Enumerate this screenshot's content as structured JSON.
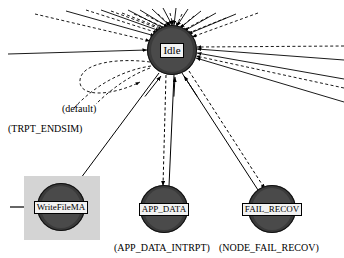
{
  "diagram": {
    "background_color": "#ffffff",
    "node_fill_color": "#3a3a3a",
    "label_box_color": "#f2f2f2",
    "selection_box_color": "#d4d4d4",
    "edge_color": "#000000"
  },
  "nodes": [
    {
      "id": "idle",
      "label": "Idle",
      "cx": 172,
      "cy": 50,
      "r": 25,
      "font_size": 11,
      "selected": false
    },
    {
      "id": "writefilema",
      "label": "WriteFileMA",
      "cx": 61,
      "cy": 207,
      "r": 24,
      "font_size": 9,
      "selected": true
    },
    {
      "id": "app_data",
      "label": "APP_DATA",
      "cx": 164,
      "cy": 209,
      "r": 24,
      "font_size": 9,
      "selected": false
    },
    {
      "id": "fail_recov",
      "label": "FAIL_RECOV",
      "cx": 272,
      "cy": 209,
      "r": 24,
      "font_size": 9,
      "selected": false
    }
  ],
  "selection": {
    "node_id": "writefilema",
    "x": 24,
    "y": 176,
    "width": 76,
    "height": 64
  },
  "edge_labels": [
    {
      "id": "default-label",
      "text": "(default)",
      "x": 62,
      "y": 104,
      "font_size": 10
    },
    {
      "id": "trpt-endsim-label",
      "text": "(TRPT_ENDSIM)",
      "x": 8,
      "y": 124,
      "font_size": 10
    }
  ],
  "node_captions": [
    {
      "id": "app-data-caption",
      "text": "(APP_DATA_INTRPT)",
      "x": 114,
      "y": 243,
      "font_size": 10
    },
    {
      "id": "fail-recov-caption",
      "text": "(NODE_FAIL_RECOV)",
      "x": 219,
      "y": 243,
      "font_size": 10
    }
  ],
  "edges": {
    "radiating_solid": [
      {
        "from": [
          66,
          11
        ],
        "to": [
          155,
          36
        ]
      },
      {
        "from": [
          101,
          10
        ],
        "to": [
          160,
          31
        ]
      },
      {
        "from": [
          128,
          10
        ],
        "to": [
          165,
          29
        ]
      },
      {
        "from": [
          140,
          10
        ],
        "to": [
          168,
          27
        ]
      },
      {
        "from": [
          152,
          9
        ],
        "to": [
          170,
          26
        ]
      },
      {
        "from": [
          163,
          8
        ],
        "to": [
          172,
          25
        ]
      },
      {
        "from": [
          176,
          8
        ],
        "to": [
          174,
          25
        ]
      },
      {
        "from": [
          188,
          9
        ],
        "to": [
          177,
          26
        ]
      },
      {
        "from": [
          201,
          11
        ],
        "to": [
          180,
          28
        ]
      },
      {
        "from": [
          216,
          13
        ],
        "to": [
          184,
          31
        ]
      },
      {
        "from": [
          236,
          14
        ],
        "to": [
          188,
          34
        ]
      },
      {
        "from": [
          8,
          54
        ],
        "to": [
          147,
          50
        ]
      },
      {
        "from": [
          344,
          79
        ],
        "to": [
          197,
          53
        ]
      },
      {
        "from": [
          344,
          102
        ],
        "to": [
          196,
          58
        ]
      },
      {
        "from": [
          344,
          60
        ],
        "to": [
          197,
          49
        ]
      }
    ],
    "radiating_dashed": [
      {
        "from": [
          35,
          14
        ],
        "to": [
          150,
          41
        ]
      },
      {
        "from": [
          86,
          10
        ],
        "to": [
          158,
          33
        ]
      },
      {
        "from": [
          111,
          11
        ],
        "to": [
          163,
          30
        ]
      },
      {
        "from": [
          122,
          13
        ],
        "to": [
          166,
          30
        ]
      },
      {
        "from": [
          134,
          14
        ],
        "to": [
          168,
          29
        ]
      },
      {
        "from": [
          146,
          15
        ],
        "to": [
          170,
          28
        ]
      },
      {
        "from": [
          158,
          14
        ],
        "to": [
          171,
          26
        ]
      },
      {
        "from": [
          170,
          13
        ],
        "to": [
          173,
          25
        ]
      },
      {
        "from": [
          182,
          14
        ],
        "to": [
          176,
          27
        ]
      },
      {
        "from": [
          194,
          16
        ],
        "to": [
          179,
          29
        ]
      },
      {
        "from": [
          208,
          17
        ],
        "to": [
          182,
          31
        ]
      },
      {
        "from": [
          226,
          18
        ],
        "to": [
          186,
          34
        ]
      },
      {
        "from": [
          258,
          13
        ],
        "to": [
          192,
          37
        ]
      },
      {
        "from": [
          344,
          46
        ],
        "to": [
          197,
          47
        ]
      },
      {
        "from": [
          344,
          88
        ],
        "to": [
          196,
          56
        ]
      }
    ],
    "self_loop": {
      "label_ids": [
        "default-label",
        "trpt-endsim-label"
      ],
      "style": "dashed"
    },
    "to_lower_nodes": [
      {
        "id": "idle-writefilema",
        "style": "solid",
        "from": [
          159,
          73
        ],
        "to": [
          72,
          190
        ]
      },
      {
        "id": "idle-app-data-dashed",
        "style": "dashed",
        "from": [
          166,
          75
        ],
        "to": [
          163,
          186
        ]
      },
      {
        "id": "idle-app-data-solid",
        "style": "solid",
        "from": [
          174,
          75
        ],
        "to": [
          169,
          186
        ]
      },
      {
        "id": "idle-fail-recov-solid",
        "style": "solid",
        "from": [
          182,
          73
        ],
        "to": [
          258,
          190
        ]
      },
      {
        "id": "idle-fail-recov-dashed",
        "style": "dashed",
        "from": [
          189,
          71
        ],
        "to": [
          265,
          189
        ]
      }
    ],
    "entry_arrow": {
      "id": "writefilema-entry",
      "from": [
        10,
        207
      ],
      "to": [
        34,
        207
      ],
      "style": "solid"
    }
  }
}
